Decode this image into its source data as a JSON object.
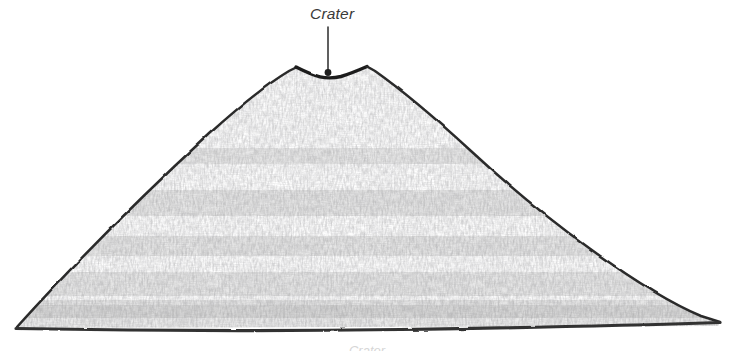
{
  "figure": {
    "type": "hand-drawn pencil sketch",
    "background_color": "#ffffff",
    "outline_color": "#2b2b2b",
    "fill_texture_color": "#9a9a9a",
    "width": 734,
    "height": 351
  },
  "annotations": [
    {
      "id": "crater",
      "label": "Crater",
      "label_x": 310,
      "label_y": 18,
      "leader_from_x": 328,
      "leader_from_y": 27,
      "leader_to_x": 328,
      "leader_to_y": 72,
      "marker": "dot",
      "marker_color": "#1f1f1f",
      "leader_color": "#2b2b2b"
    }
  ],
  "geometry": {
    "base_left_x": 16,
    "base_left_y": 328,
    "base_right_x": 720,
    "base_right_y": 322,
    "peak_left_x": 297,
    "peak_left_y": 68,
    "peak_right_x": 367,
    "peak_right_y": 67,
    "crater_low_x": 330,
    "crater_low_y": 77
  },
  "caption": {
    "ghost_text": "Crater",
    "visible": "partially cropped at bottom edge"
  }
}
